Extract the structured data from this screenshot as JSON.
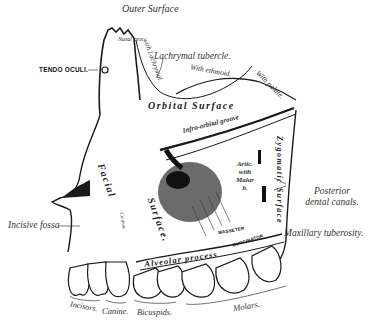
{
  "title": "Outer Surface",
  "labels": {
    "tendo_oculi": "TENDO OCULI.",
    "lachrymal_tubercle": "Lachrymal tubercle.",
    "with_ethmoid": "With ethmoid.",
    "with_palate": "With palate.",
    "with_lachrymal": "with Lachrymal.",
    "nasal_process": "Nasal proc.",
    "orbital_surface": "Orbital Surface",
    "infra_orbital_groove": "Infra-orbital groove",
    "facial": "Facial",
    "surface": "Surface.",
    "artic_with_malar": "Artic. with Malar b.",
    "zygomatic_surface": "Zygomatic Surface",
    "posterior_dental_canals": "Posterior dental canals.",
    "maxillary_tuberosity": "Maxillary tuberosity.",
    "incisive_fossa": "Incisive fossa",
    "alveolar_process": "Alveolar process",
    "buccinator": "BUCCINATOR",
    "masseter": "MASSETER",
    "caninus": "Caninus"
  },
  "teeth_labels": {
    "incisors": "Incisors.",
    "canine": "Canine.",
    "bicuspids": "Bicuspids.",
    "molars": "Molars."
  },
  "colors": {
    "ink": "#1a1a1a",
    "paper": "#ffffff",
    "shade": "#555555"
  }
}
